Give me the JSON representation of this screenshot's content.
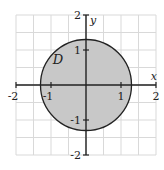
{
  "diagram": {
    "x_range": [
      -2,
      2
    ],
    "y_range": [
      -2,
      2
    ],
    "grid_step": 0.5,
    "x_axis_label": "x",
    "y_axis_label": "y",
    "region_label": "D",
    "region": {
      "shape": "disk",
      "center": [
        0,
        0
      ],
      "radius": 1.3
    },
    "x_ticks": [
      {
        "value": -2,
        "label": "-2"
      },
      {
        "value": -1,
        "label": "-1"
      },
      {
        "value": 1,
        "label": "1"
      },
      {
        "value": 2,
        "label": "2"
      }
    ],
    "y_ticks": [
      {
        "value": 2,
        "label": "2"
      },
      {
        "value": 1,
        "label": "1"
      },
      {
        "value": -1,
        "label": "-1"
      },
      {
        "value": -2,
        "label": "-2"
      }
    ],
    "colors": {
      "fill": "#c8c8c8",
      "stroke": "#222222",
      "grid": "#d9d9d9"
    }
  }
}
